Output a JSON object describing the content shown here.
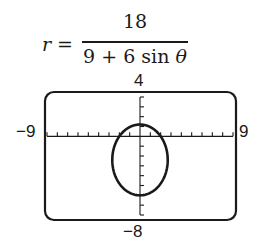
{
  "equation": {
    "lhs": "r",
    "equals": "=",
    "numerator": "18",
    "denominator_prefix": "9 + 6 sin ",
    "denominator_var": "θ"
  },
  "window": {
    "xmin_label": "−9",
    "xmax_label": "9",
    "ymax_label": "4",
    "ymin_label": "−8"
  },
  "colors": {
    "ink": "#1a1a1a",
    "background": "#ffffff"
  },
  "chart_data": {
    "type": "line",
    "subtitle": "Polar graph on graphing-calculator window",
    "xlabel": "",
    "ylabel": "",
    "xlim": [
      -9,
      9
    ],
    "ylim": [
      -8,
      4
    ],
    "xscale_ticks": 1,
    "yscale_ticks": 1,
    "grid": false,
    "legend": null,
    "series": [
      {
        "name": "r = 18/(9 + 6 sin θ)",
        "curve": "ellipse",
        "center": [
          0,
          -2.4
        ],
        "semi_axis_x": 2.68,
        "semi_axis_y": 3.6,
        "points": [
          {
            "x": 0,
            "y": 1.2
          },
          {
            "x": 2,
            "y": 0
          },
          {
            "x": -2,
            "y": 0
          },
          {
            "x": 2.68,
            "y": -2.4
          },
          {
            "x": -2.68,
            "y": -2.4
          },
          {
            "x": 0,
            "y": -6
          }
        ]
      }
    ],
    "tick_labels": {
      "x": [
        "−9",
        "9"
      ],
      "y": [
        "4",
        "−8"
      ]
    }
  }
}
